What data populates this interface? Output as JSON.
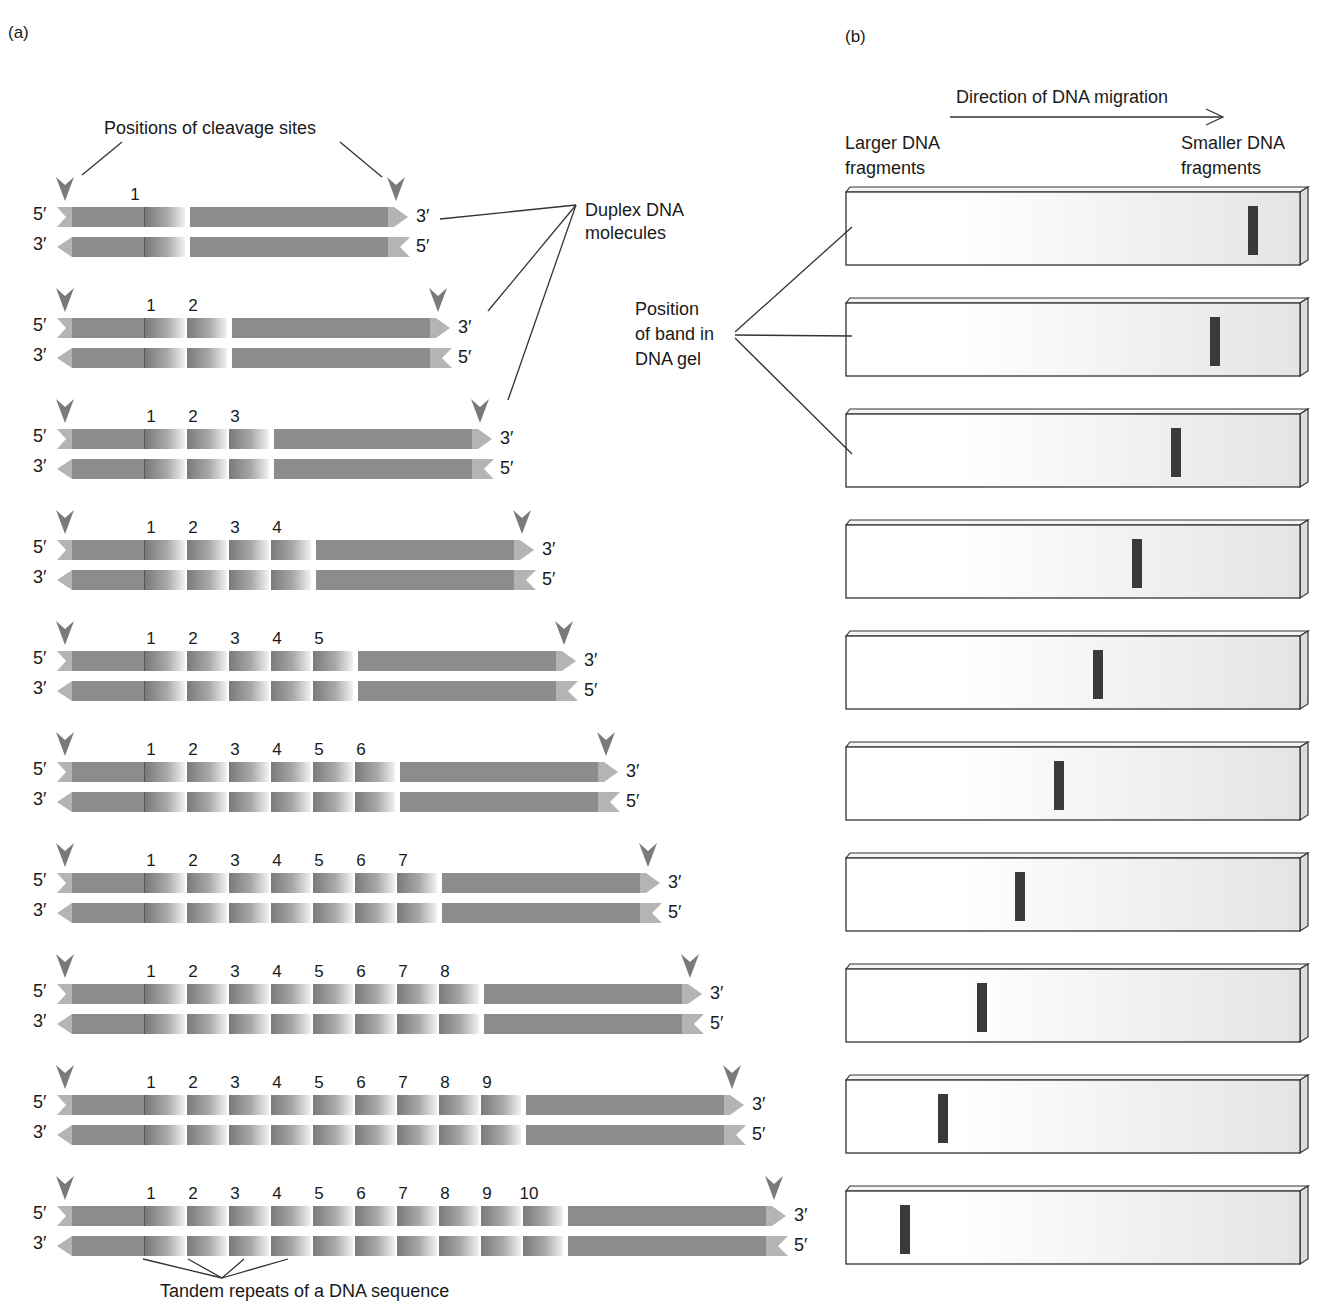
{
  "panel_a": {
    "label": "(a)",
    "cleavage_label": "Positions of cleavage sites",
    "duplex_label_line1": "Duplex DNA",
    "duplex_label_line2": "molecules",
    "tandem_label": "Tandem repeats of a DNA sequence",
    "top_left_end": "5′",
    "top_right_end": "3′",
    "bottom_left_end": "3′",
    "bottom_right_end": "5′",
    "rows": [
      {
        "repeats": 1
      },
      {
        "repeats": 2
      },
      {
        "repeats": 3
      },
      {
        "repeats": 4
      },
      {
        "repeats": 5
      },
      {
        "repeats": 6
      },
      {
        "repeats": 7
      },
      {
        "repeats": 8
      },
      {
        "repeats": 9
      },
      {
        "repeats": 10
      }
    ]
  },
  "panel_b": {
    "label": "(b)",
    "direction_label": "Direction of DNA migration",
    "larger_line1": "Larger DNA",
    "larger_line2": "fragments",
    "smaller_line1": "Smaller DNA",
    "smaller_line2": "fragments",
    "band_label_line1": "Position",
    "band_label_line2": "of band in",
    "band_label_line3": "DNA gel",
    "gels": [
      {
        "repeats": 1,
        "band_x": 1253
      },
      {
        "repeats": 2,
        "band_x": 1215
      },
      {
        "repeats": 3,
        "band_x": 1176
      },
      {
        "repeats": 4,
        "band_x": 1137
      },
      {
        "repeats": 5,
        "band_x": 1098
      },
      {
        "repeats": 6,
        "band_x": 1059
      },
      {
        "repeats": 7,
        "band_x": 1020
      },
      {
        "repeats": 8,
        "band_x": 982
      },
      {
        "repeats": 9,
        "band_x": 943
      },
      {
        "repeats": 10,
        "band_x": 905
      }
    ]
  },
  "colors": {
    "strand": "#8c8c8c",
    "strand_end": "#b4b4b4",
    "arrowhead": "#7a7a7a",
    "band": "#3a3a3a",
    "gel_edge": "#333333"
  }
}
